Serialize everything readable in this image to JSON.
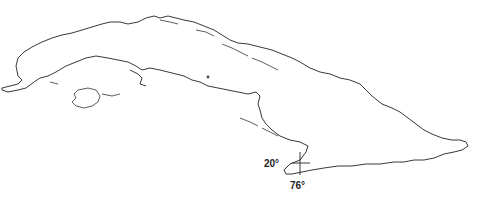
{
  "map": {
    "subject": "Outline map of Cuba",
    "coordinate_marker": {
      "latitude_label": "20°",
      "longitude_label": "76°"
    },
    "colors": {
      "background": "#ffffff",
      "coastline": "#222222"
    }
  }
}
